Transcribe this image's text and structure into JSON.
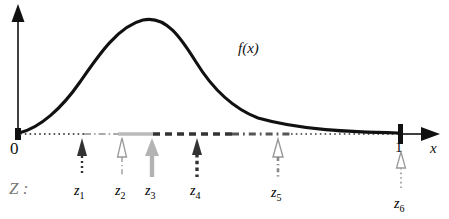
{
  "figure": {
    "background": "#ffffff"
  },
  "axes": {
    "y_axis": {
      "name": "vertical-axis",
      "color": "#111111"
    },
    "x_axis": {
      "name": "horizontal-axis",
      "color": "#111111",
      "label": "x"
    },
    "origin_label": "0",
    "one_label": "1",
    "x_label": "x"
  },
  "curve": {
    "label": "f(x)",
    "color": "#111111",
    "description": "unimodal density rising from 0, peaking near x=0.35, decaying to 0 at x=1"
  },
  "interval_label": "Z :",
  "colors": {
    "black": "#111111",
    "gray": "#aaaaaa",
    "mid_gray": "#888888",
    "label_gray": "#777777"
  },
  "markers": [
    {
      "id": "z1",
      "label": "z",
      "sub": "1",
      "x_px": 82,
      "style": "dotted",
      "arrow": "filled",
      "color": "#333333"
    },
    {
      "id": "z2",
      "label": "z",
      "sub": "2",
      "x_px": 122,
      "style": "dashdot",
      "arrow": "hollow",
      "color": "#999999"
    },
    {
      "id": "z3",
      "label": "z",
      "sub": "3",
      "x_px": 152,
      "style": "solid",
      "arrow": "filled",
      "color": "#b0b0b0"
    },
    {
      "id": "z4",
      "label": "z",
      "sub": "4",
      "x_px": 197,
      "style": "dashed",
      "arrow": "filled",
      "color": "#333333"
    },
    {
      "id": "z5",
      "label": "z",
      "sub": "5",
      "x_px": 278,
      "style": "dashdot",
      "arrow": "hollow",
      "color": "#999999"
    },
    {
      "id": "z6",
      "label": "z",
      "sub": "6",
      "x_px": 401,
      "style": "dotted",
      "arrow": "hollow",
      "color": "#999999"
    }
  ],
  "baseline_segments": [
    {
      "from_px": 20,
      "to_px": 84,
      "style": "dotted",
      "color": "#555555",
      "width": 2
    },
    {
      "from_px": 84,
      "to_px": 119,
      "style": "dashdot",
      "color": "#aaaaaa",
      "width": 2
    },
    {
      "from_px": 119,
      "to_px": 153,
      "style": "solid",
      "color": "#bbbbbb",
      "width": 3
    },
    {
      "from_px": 153,
      "to_px": 290,
      "style": "dashed",
      "color": "#333333",
      "width": 3
    },
    {
      "from_px": 290,
      "to_px": 400,
      "style": "dotted",
      "color": "#555555",
      "width": 2
    }
  ]
}
